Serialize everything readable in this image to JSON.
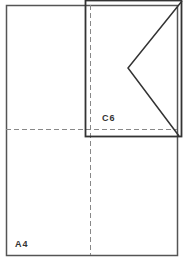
{
  "diagram": {
    "sheet": {
      "label": "A4",
      "x": 6,
      "y": 5,
      "width": 171,
      "height": 250
    },
    "envelope": {
      "label": "C6",
      "x": 85,
      "y": 0,
      "width": 97,
      "height": 137
    },
    "fold_lines": {
      "vertical_x": 90,
      "horizontal_y": 129
    },
    "flap": {
      "top": [
        182,
        0
      ],
      "apex": [
        128,
        68
      ],
      "bottom": [
        179,
        136
      ]
    },
    "colors": {
      "line": "#333333",
      "dash": "#888888",
      "background": "#ffffff"
    }
  }
}
